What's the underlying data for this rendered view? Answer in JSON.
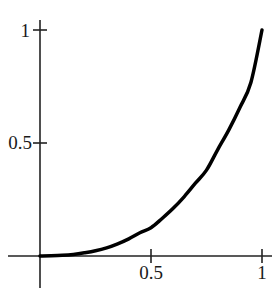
{
  "figure": {
    "background_color": "#ffffff",
    "width": 273,
    "height": 293
  },
  "axes": {
    "x_axis_name": "x-axis",
    "y_axis_name": "y-axis",
    "axis_color": "#222222",
    "origin_px": {
      "x": 40,
      "y": 256
    },
    "unit_px": {
      "x": 222,
      "y": 226
    }
  },
  "labels": {
    "y_top": "1",
    "y_mid": "0.5",
    "x_mid": "0.5",
    "x_right": "1"
  },
  "chart_data": {
    "type": "line",
    "title": "",
    "subtitle": "",
    "xlabel": "",
    "ylabel": "",
    "xlim": [
      0,
      1
    ],
    "ylim": [
      0,
      1
    ],
    "grid": false,
    "legend": false,
    "legend_position": "none",
    "xticks": [
      0.5,
      1
    ],
    "xticklabels": [
      "0.5",
      "1"
    ],
    "yticks": [
      0.5,
      1
    ],
    "yticklabels": [
      "0.5",
      "1"
    ],
    "annotations": [],
    "series": [
      {
        "name": "curve",
        "color": "#000000",
        "line_width": 3.5,
        "x": [
          0.0,
          0.05,
          0.1,
          0.15,
          0.2,
          0.25,
          0.3,
          0.35,
          0.4,
          0.45,
          0.5,
          0.55,
          0.6,
          0.65,
          0.7,
          0.75,
          0.8,
          0.85,
          0.9,
          0.95,
          1.0
        ],
        "values": [
          0.0,
          0.001,
          0.003,
          0.007,
          0.014,
          0.023,
          0.036,
          0.054,
          0.076,
          0.103,
          0.125,
          0.166,
          0.211,
          0.263,
          0.322,
          0.38,
          0.47,
          0.557,
          0.656,
          0.768,
          1.0
        ]
      }
    ]
  }
}
